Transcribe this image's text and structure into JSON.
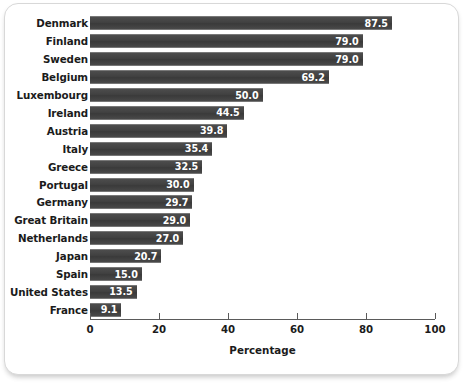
{
  "chart_data": {
    "type": "bar",
    "orientation": "horizontal",
    "title": "",
    "xlabel": "Percentage",
    "ylabel": "",
    "xlim": [
      0,
      100
    ],
    "xticks": [
      0,
      20,
      40,
      60,
      80,
      100
    ],
    "xtick_labels": [
      "0",
      "20",
      "40",
      "60",
      "80",
      "100"
    ],
    "grid": false,
    "legend": null,
    "bar_color": "#474747",
    "value_label_color": "#ffffff",
    "categories": [
      "Denmark",
      "Finland",
      "Sweden",
      "Belgium",
      "Luxembourg",
      "Ireland",
      "Austria",
      "Italy",
      "Greece",
      "Portugal",
      "Germany",
      "Great Britain",
      "Netherlands",
      "Japan",
      "Spain",
      "United States",
      "France"
    ],
    "values": [
      87.5,
      79.0,
      79.0,
      69.2,
      50.0,
      44.5,
      39.8,
      35.4,
      32.5,
      30.0,
      29.7,
      29.0,
      27.0,
      20.7,
      15.0,
      13.5,
      9.1
    ],
    "value_labels": [
      "87.5",
      "79.0",
      "79.0",
      "69.2",
      "50.0",
      "44.5",
      "39.8",
      "35.4",
      "32.5",
      "30.0",
      "29.7",
      "29.0",
      "27.0",
      "20.7",
      "15.0",
      "13.5",
      "9.1"
    ]
  }
}
